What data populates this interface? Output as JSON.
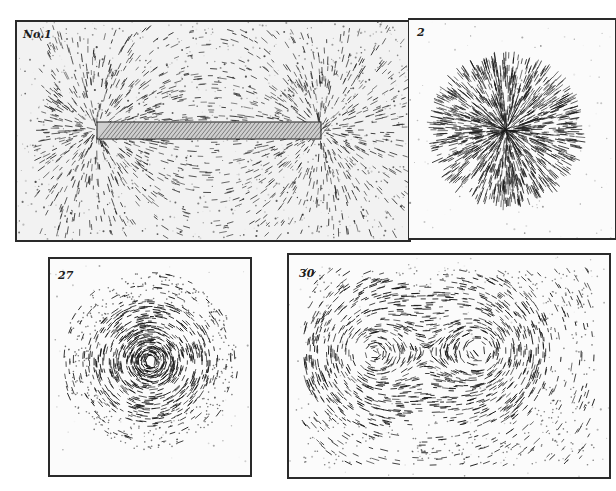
{
  "figure": {
    "panels": [
      {
        "id": "p1",
        "label": "No.1",
        "subject": "bar magnet iron filings field"
      },
      {
        "id": "p2",
        "label": "2",
        "subject": "single pole radial filings"
      },
      {
        "id": "p3",
        "label": "27",
        "subject": "circular field around single conductor"
      },
      {
        "id": "p4",
        "label": "30",
        "subject": "field around two parallel conductors"
      }
    ],
    "colors": {
      "ink": "#1c1c1c",
      "paper": "#fbfbfb",
      "border": "#2a2a2a"
    }
  }
}
